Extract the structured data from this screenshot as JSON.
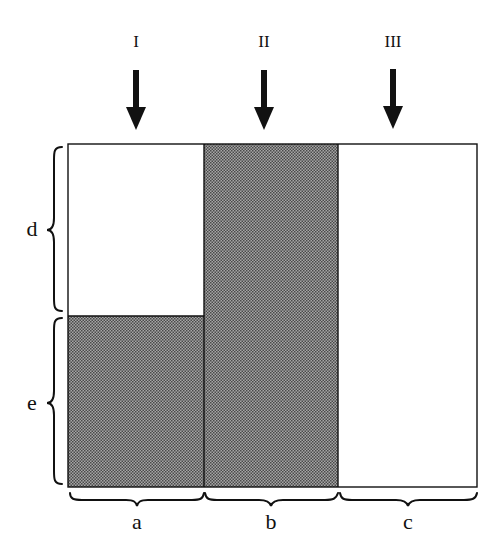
{
  "arrows": [
    {
      "label": "I",
      "x": 136
    },
    {
      "label": "II",
      "x": 264
    },
    {
      "label": "III",
      "x": 393
    }
  ],
  "columns": [
    {
      "label": "a",
      "x0": 68,
      "x1": 204,
      "shaded_from_y": 316
    },
    {
      "label": "b",
      "x0": 204,
      "x1": 338,
      "shaded_from_y": 144
    },
    {
      "label": "c",
      "x0": 338,
      "x1": 477,
      "shaded_from_y": null
    }
  ],
  "rows": [
    {
      "label": "d",
      "y0": 144,
      "y1": 314
    },
    {
      "label": "e",
      "y0": 314,
      "y1": 487
    }
  ],
  "colors": {
    "stroke": "#111111",
    "shade_base": "#9a9a9a",
    "shade_dot": "#3a3a3a",
    "background": "#ffffff"
  }
}
